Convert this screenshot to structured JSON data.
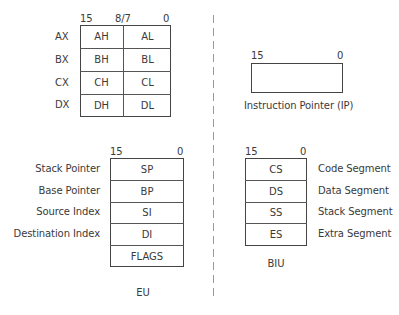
{
  "general_registers": {
    "bit_labels": {
      "high": "15",
      "mid": "8/7",
      "low": "0"
    },
    "rows": [
      {
        "name": "AX",
        "high": "AH",
        "low": "AL"
      },
      {
        "name": "BX",
        "high": "BH",
        "low": "BL"
      },
      {
        "name": "CX",
        "high": "CH",
        "low": "CL"
      },
      {
        "name": "DX",
        "high": "DH",
        "low": "DL"
      }
    ]
  },
  "instruction_pointer": {
    "bit_labels": {
      "high": "15",
      "low": "0"
    },
    "label": "Instruction Pointer  (IP)"
  },
  "eu": {
    "bit_labels": {
      "high": "15",
      "low": "0"
    },
    "rows": [
      {
        "description": "Stack Pointer",
        "register": "SP"
      },
      {
        "description": "Base Pointer",
        "register": "BP"
      },
      {
        "description": "Source Index",
        "register": "SI"
      },
      {
        "description": "Destination Index",
        "register": "DI"
      },
      {
        "description": "",
        "register": "FLAGS"
      }
    ],
    "label": "EU"
  },
  "biu": {
    "bit_labels": {
      "high": "15",
      "low": "0"
    },
    "rows": [
      {
        "register": "CS",
        "description": "Code Segment"
      },
      {
        "register": "DS",
        "description": "Data Segment"
      },
      {
        "register": "SS",
        "description": "Stack Segment"
      },
      {
        "register": "ES",
        "description": "Extra Segment"
      }
    ],
    "label": "BIU"
  },
  "colors": {
    "line": "#444444",
    "text": "#3a3a3a",
    "divider": "#9a9a9a"
  }
}
